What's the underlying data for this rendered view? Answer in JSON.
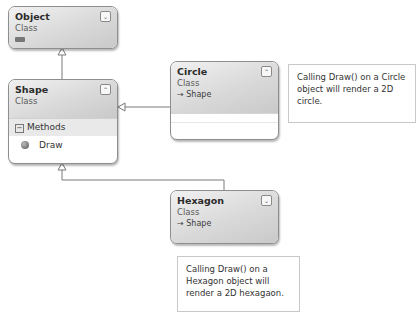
{
  "classes": {
    "object": {
      "name": "Object",
      "kind": "Class",
      "toggle": "⌄"
    },
    "shape": {
      "name": "Shape",
      "kind": "Class",
      "toggle": "⌃",
      "section": "Methods",
      "section_toggle": "−",
      "methods": [
        "Draw"
      ]
    },
    "circle": {
      "name": "Circle",
      "kind": "Class",
      "base": "→ Shape",
      "toggle": "⌃"
    },
    "hexagon": {
      "name": "Hexagon",
      "kind": "Class",
      "base": "→ Shape",
      "toggle": "⌄"
    }
  },
  "comments": {
    "circle": "Calling Draw() on a Circle object will render a 2D circle.",
    "hexagon": "Calling Draw() on a Hexagon object will render a 2D hexagaon."
  },
  "colors": {
    "border": "#8e8e8e",
    "header_light": "#f1f1f1",
    "header_dark": "#c9c9c9",
    "line": "#7a7a7a"
  }
}
